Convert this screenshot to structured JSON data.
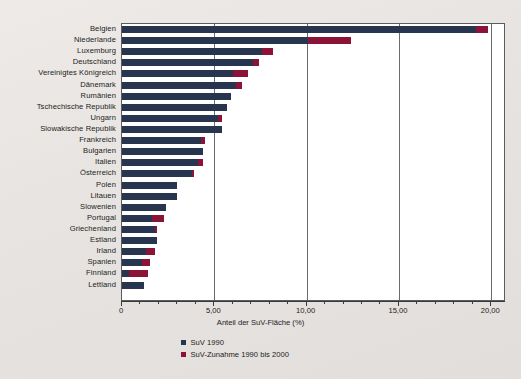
{
  "chart_data": {
    "type": "bar",
    "orientation": "horizontal",
    "stacked": true,
    "title": "",
    "xlabel": "Anteil der SuV-Fläche (%)",
    "ylabel": "",
    "xlim": [
      0,
      20.8
    ],
    "xticks": [
      0,
      5,
      10,
      15,
      20
    ],
    "xticklabels": [
      "0",
      "5,00",
      "10,00",
      "15,00",
      "20,00"
    ],
    "minor_tick_step": 1,
    "grid": "vertical-at-major-ticks",
    "legend_position": "below-axis-center",
    "categories": [
      "Belgien",
      "Niederlande",
      "Luxemburg",
      "Deutschland",
      "Vereinigtes Königreich",
      "Dänemark",
      "Rumänien",
      "Tschechische Republik",
      "Ungarn",
      "Slowakische Republik",
      "Frankreich",
      "Bulgarien",
      "Italien",
      "Österreich",
      "Polen",
      "Litauen",
      "Slowenien",
      "Portugal",
      "Griechenland",
      "Estland",
      "Irland",
      "Spanien",
      "Finnland",
      "Lettland"
    ],
    "series": [
      {
        "name": "SuV 1990",
        "color": "#27354f",
        "values": [
          19.2,
          10.1,
          7.6,
          7.1,
          6.0,
          6.2,
          5.9,
          5.7,
          5.2,
          5.4,
          4.3,
          4.4,
          4.1,
          3.8,
          3.0,
          3.0,
          2.4,
          1.6,
          1.8,
          1.9,
          1.3,
          1.1,
          0.4,
          1.2
        ]
      },
      {
        "name": "SuV-Zunahme 1990 bis 2000",
        "color": "#8c1338",
        "values": [
          0.6,
          2.3,
          0.6,
          0.3,
          0.8,
          0.3,
          0.0,
          0.0,
          0.2,
          0.0,
          0.2,
          0.0,
          0.3,
          0.1,
          0.0,
          0.0,
          0.0,
          0.7,
          0.1,
          0.0,
          0.5,
          0.4,
          1.0,
          0.0
        ]
      }
    ],
    "totals": [
      19.8,
      12.4,
      8.2,
      7.4,
      6.8,
      6.5,
      5.9,
      5.7,
      5.4,
      5.4,
      4.5,
      4.4,
      4.4,
      3.9,
      3.0,
      3.0,
      2.4,
      2.3,
      1.9,
      1.9,
      1.8,
      1.5,
      1.4,
      1.2
    ]
  },
  "legend": {
    "items": [
      {
        "label": "SuV 1990",
        "color": "#27354f",
        "swatch": "square-swatch-navy"
      },
      {
        "label": "SuV-Zunahme 1990 bis 2000",
        "color": "#8c1338",
        "swatch": "square-swatch-crimson"
      }
    ]
  },
  "colors": {
    "series_1990": "#27354f",
    "series_increase": "#8c1338",
    "plot_background": "#ffffff",
    "figure_background": "#e9e6e4",
    "axis": "#3a3a3e",
    "gridline": "#6b6b70"
  }
}
